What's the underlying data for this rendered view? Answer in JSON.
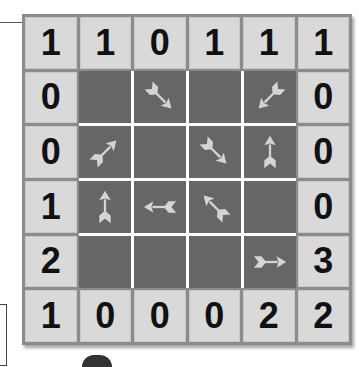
{
  "puzzle": {
    "type": "arrow-grid",
    "size": 6,
    "top_clues": [
      "1",
      "1",
      "0",
      "1",
      "1",
      "1"
    ],
    "bottom_clues": [
      "1",
      "0",
      "0",
      "0",
      "2",
      "2"
    ],
    "left_clues": [
      "0",
      "0",
      "1",
      "2"
    ],
    "right_clues": [
      "0",
      "0",
      "0",
      "3"
    ],
    "cells": [
      [
        "empty",
        "arrow-se",
        "empty",
        "arrow-sw"
      ],
      [
        "arrow-ne",
        "empty",
        "arrow-se",
        "arrow-n"
      ],
      [
        "arrow-n",
        "arrow-w",
        "arrow-nw",
        "empty"
      ],
      [
        "empty",
        "empty",
        "empty",
        "arrow-e"
      ]
    ]
  },
  "colors": {
    "clue_bg": "#d9d9d9",
    "cell_bg": "#666666",
    "arrow": "#d4d4d4",
    "board_border": "#8c8c8c",
    "gridline": "#ffffff"
  }
}
